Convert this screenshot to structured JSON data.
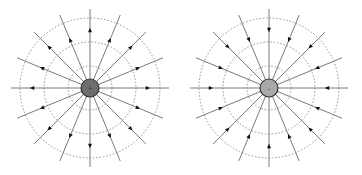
{
  "diagrams": [
    {
      "name": "positive-charge",
      "charge_sign": "+",
      "field_direction": "outward",
      "charge_fill": "#6e6e6e",
      "num_field_lines": 16,
      "equipotential_circles": 3
    },
    {
      "name": "negative-charge",
      "charge_sign": "-",
      "field_direction": "inward",
      "charge_fill": "#a9a9a9",
      "num_field_lines": 16,
      "equipotential_circles": 3
    }
  ],
  "colors": {
    "field_line": "#7a7a7a",
    "arrow": "#111111",
    "equipotential": "#8a8a8a",
    "charge_stroke": "#333333"
  }
}
